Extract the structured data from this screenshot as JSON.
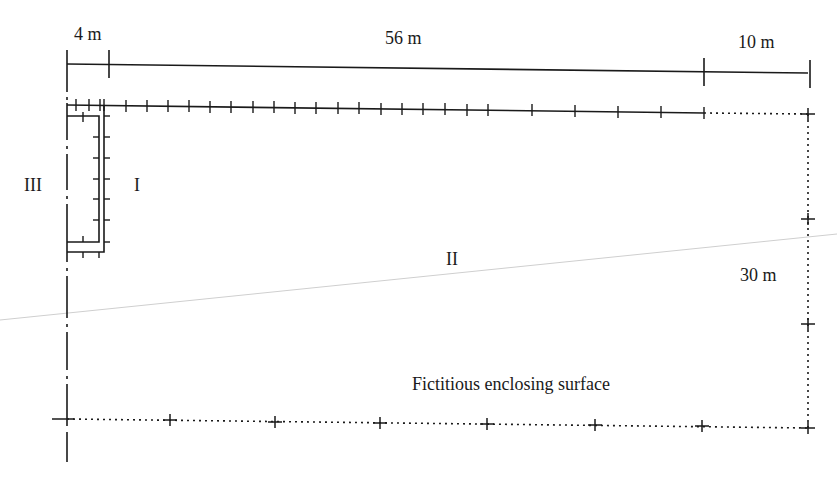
{
  "diagram": {
    "type": "site-plan",
    "colors": {
      "ink": "#1a1a1a",
      "faint_line": "#c8c8c8",
      "background": "#ffffff"
    },
    "dimensions": {
      "left_segment": "4 m",
      "middle_segment": "56 m",
      "right_segment": "10 m",
      "vertical_segment": "30 m"
    },
    "regions": {
      "region_1": "I",
      "region_2": "II",
      "region_3": "III"
    },
    "annotation": "Fictitious enclosing surface",
    "legend_lines": {
      "solid_with_ticks": "wall-with-measurement-points",
      "dotted_with_crosses": "fictitious-enclosing-surface",
      "dash_dot": "boundary-axis"
    }
  }
}
